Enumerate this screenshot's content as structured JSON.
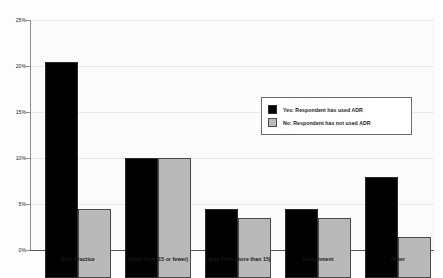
{
  "chart_data": {
    "type": "bar",
    "title": "",
    "subtitle": "",
    "xlabel": "",
    "ylabel": "",
    "ylim": [
      0,
      25
    ],
    "ytick_labels": [
      "25%",
      "20%",
      "15%",
      "10%",
      "5%",
      "0%"
    ],
    "ytick_values": [
      25,
      20,
      15,
      10,
      5,
      0
    ],
    "grid": true,
    "legend_position": "center-right",
    "categories": [
      "Solo Practice",
      "Small Firm (15 or fewer)",
      "Large Firm (more than 15)",
      "Government",
      "Other"
    ],
    "series": [
      {
        "name": "Yes: Respondent has used ADR",
        "color": "#000000",
        "values": [
          23.5,
          13.0,
          7.5,
          7.5,
          11.0
        ]
      },
      {
        "name": "No: Respondent has not used ADR",
        "color": "#b9b9b9",
        "values": [
          7.5,
          13.0,
          6.5,
          6.5,
          4.5
        ]
      }
    ]
  }
}
